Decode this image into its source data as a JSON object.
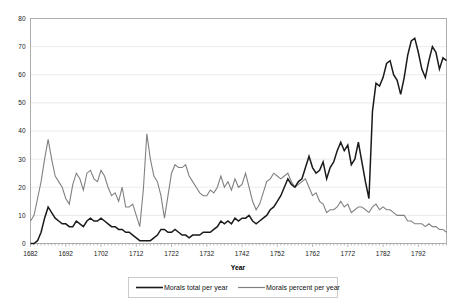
{
  "chart_data": {
    "type": "line",
    "title": "",
    "xlabel": "Year",
    "ylabel": "",
    "xlim": [
      1682,
      1800
    ],
    "ylim": [
      0,
      80
    ],
    "grid": true,
    "legend_position": "bottom",
    "x_tick_labels": [
      "1682",
      "1692",
      "1702",
      "1712",
      "1722",
      "1732",
      "1742",
      "1752",
      "1762",
      "1772",
      "1782",
      "1792"
    ],
    "x_ticks": [
      1682,
      1692,
      1702,
      1712,
      1722,
      1732,
      1742,
      1752,
      1762,
      1772,
      1782,
      1792
    ],
    "y_tick_labels": [
      "0",
      "10",
      "20",
      "30",
      "40",
      "50",
      "60",
      "70",
      "80"
    ],
    "y_ticks": [
      0,
      10,
      20,
      30,
      40,
      50,
      60,
      70,
      80
    ],
    "x": [
      1682,
      1683,
      1684,
      1685,
      1686,
      1687,
      1688,
      1689,
      1690,
      1691,
      1692,
      1693,
      1694,
      1695,
      1696,
      1697,
      1698,
      1699,
      1700,
      1701,
      1702,
      1703,
      1704,
      1705,
      1706,
      1707,
      1708,
      1709,
      1710,
      1711,
      1712,
      1713,
      1714,
      1715,
      1716,
      1717,
      1718,
      1719,
      1720,
      1721,
      1722,
      1723,
      1724,
      1725,
      1726,
      1727,
      1728,
      1729,
      1730,
      1731,
      1732,
      1733,
      1734,
      1735,
      1736,
      1737,
      1738,
      1739,
      1740,
      1741,
      1742,
      1743,
      1744,
      1745,
      1746,
      1747,
      1748,
      1749,
      1750,
      1751,
      1752,
      1753,
      1754,
      1755,
      1756,
      1757,
      1758,
      1759,
      1760,
      1761,
      1762,
      1763,
      1764,
      1765,
      1766,
      1767,
      1768,
      1769,
      1770,
      1771,
      1772,
      1773,
      1774,
      1775,
      1776,
      1777,
      1778,
      1779,
      1780,
      1781,
      1782,
      1783,
      1784,
      1785,
      1786,
      1787,
      1788,
      1789,
      1790,
      1791,
      1792,
      1793,
      1794,
      1795,
      1796,
      1797,
      1798,
      1799,
      1800
    ],
    "series": [
      {
        "name": "Morals total per year",
        "color": "#1a1a1a",
        "width": 1.5,
        "values": [
          0,
          0,
          1,
          4,
          9,
          13,
          11,
          9,
          8,
          7,
          7,
          6,
          6,
          8,
          7,
          6,
          8,
          9,
          8,
          8,
          9,
          8,
          7,
          6,
          6,
          5,
          5,
          4,
          4,
          3,
          2,
          1,
          1,
          1,
          1,
          2,
          3,
          5,
          5,
          4,
          4,
          5,
          4,
          3,
          3,
          2,
          3,
          3,
          3,
          4,
          4,
          4,
          5,
          6,
          8,
          7,
          8,
          7,
          9,
          8,
          9,
          9,
          10,
          8,
          7,
          8,
          9,
          10,
          12,
          13,
          15,
          17,
          20,
          23,
          21,
          20,
          22,
          23,
          27,
          31,
          27,
          25,
          26,
          29,
          23,
          27,
          29,
          33,
          36,
          33,
          35,
          28,
          30,
          36,
          29,
          22,
          16,
          47,
          57,
          56,
          59,
          64,
          65,
          60,
          58,
          53,
          59,
          67,
          72,
          73,
          68,
          62,
          59,
          65,
          70,
          68,
          62,
          66,
          65
        ]
      },
      {
        "name": "Morals percent per year",
        "color": "#808080",
        "width": 1.1,
        "values": [
          8,
          10,
          16,
          22,
          30,
          37,
          30,
          24,
          22,
          20,
          16,
          14,
          21,
          25,
          23,
          19,
          25,
          26,
          23,
          22,
          26,
          24,
          20,
          17,
          18,
          15,
          20,
          13,
          13,
          14,
          10,
          6,
          19,
          39,
          30,
          24,
          22,
          17,
          9,
          17,
          25,
          28,
          27,
          27,
          28,
          24,
          22,
          20,
          18,
          17,
          17,
          19,
          18,
          20,
          24,
          20,
          22,
          19,
          23,
          20,
          21,
          25,
          20,
          15,
          12,
          14,
          18,
          22,
          23,
          25,
          24,
          23,
          24,
          25,
          22,
          20,
          21,
          22,
          23,
          20,
          17,
          18,
          15,
          14,
          11,
          12,
          12,
          13,
          15,
          13,
          14,
          11,
          12,
          13,
          13,
          12,
          11,
          13,
          14,
          12,
          13,
          12,
          12,
          11,
          10,
          10,
          10,
          8,
          8,
          7,
          7,
          7,
          6,
          7,
          6,
          6,
          5,
          5,
          4
        ]
      }
    ]
  },
  "legend": {
    "items": [
      {
        "label": "Morals total per year"
      },
      {
        "label": "Morals percent per year"
      }
    ]
  },
  "axes": {
    "x_title": "Year"
  }
}
